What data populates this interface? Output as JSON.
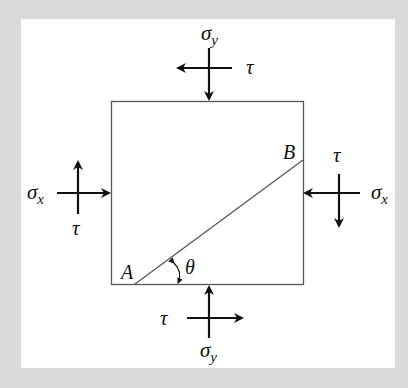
{
  "diagram": {
    "type": "stress-element",
    "colors": {
      "background": "#d9d9d9",
      "panel": "#ffffff",
      "ink": "#111111",
      "box_line": "#555555"
    },
    "labels": {
      "sigma_y_top": "σ",
      "sigma_y_top_sub": "y",
      "tau_top": "τ",
      "sigma_x_left": "σ",
      "sigma_x_left_sub": "x",
      "tau_left": "τ",
      "sigma_x_right": "σ",
      "sigma_x_right_sub": "x",
      "tau_right": "τ",
      "tau_bottom": "τ",
      "sigma_y_bottom": "σ",
      "sigma_y_bottom_sub": "y",
      "point_a": "A",
      "point_b": "B",
      "angle": "θ"
    }
  }
}
